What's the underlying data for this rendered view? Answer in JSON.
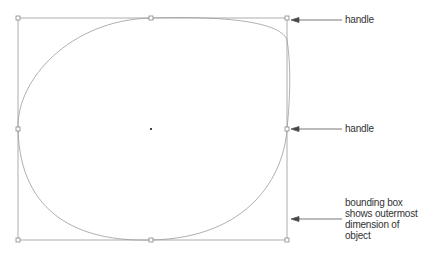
{
  "diagram": {
    "bounding_box": {
      "x1": 18,
      "y1": 18,
      "x2": 287,
      "y2": 240
    },
    "handles": [
      {
        "name": "top-left",
        "x": 18,
        "y": 18
      },
      {
        "name": "top-middle",
        "x": 151,
        "y": 18
      },
      {
        "name": "top-right",
        "x": 287,
        "y": 18
      },
      {
        "name": "middle-left",
        "x": 18,
        "y": 129
      },
      {
        "name": "middle-right",
        "x": 287,
        "y": 129
      },
      {
        "name": "bottom-left",
        "x": 18,
        "y": 240
      },
      {
        "name": "bottom-middle",
        "x": 151,
        "y": 240
      },
      {
        "name": "bottom-right",
        "x": 287,
        "y": 240
      }
    ],
    "center_point": {
      "x": 151,
      "y": 129
    },
    "annotations": [
      {
        "id": "handle-top",
        "text": "handle"
      },
      {
        "id": "handle-middle",
        "text": "handle"
      },
      {
        "id": "bounding-box",
        "lines": [
          "bounding box",
          "shows outermost",
          "dimension of object"
        ]
      }
    ],
    "colors": {
      "line": "#9a9a9a",
      "arrow": "#444444",
      "text": "#333333"
    }
  }
}
